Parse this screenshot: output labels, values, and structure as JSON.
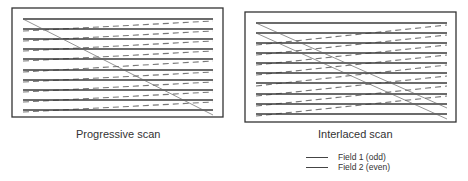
{
  "panels": [
    {
      "id": "progressive",
      "caption": "Progressive scan",
      "frame": {
        "x": 12,
        "y": 8,
        "w": 211,
        "h": 109
      },
      "line_x": [
        23,
        213
      ],
      "solid_lines_y": [
        19,
        29,
        39,
        49,
        59,
        70,
        80,
        90,
        100,
        110
      ],
      "dashed_lines": [
        [
          23,
          31,
          213,
          21
        ],
        [
          23,
          41,
          213,
          31
        ],
        [
          23,
          51,
          213,
          41
        ],
        [
          23,
          61,
          213,
          51
        ],
        [
          23,
          72,
          213,
          61
        ],
        [
          23,
          82,
          213,
          72
        ],
        [
          23,
          92,
          213,
          82
        ],
        [
          23,
          102,
          213,
          92
        ],
        [
          23,
          112,
          213,
          102
        ]
      ],
      "diagonals": [
        [
          23,
          19,
          213,
          115
        ]
      ]
    },
    {
      "id": "interlaced",
      "caption": "Interlaced scan",
      "frame": {
        "x": 245,
        "y": 12,
        "w": 211,
        "h": 110
      },
      "line_x": [
        256,
        447
      ],
      "solid_lines_y": [
        23,
        33,
        43,
        53,
        63,
        73,
        83,
        94,
        104,
        114
      ],
      "dashed_lines": [
        [
          256,
          45,
          447,
          25
        ],
        [
          256,
          55,
          447,
          35
        ],
        [
          256,
          65,
          447,
          45
        ],
        [
          256,
          75,
          447,
          55
        ],
        [
          256,
          86,
          447,
          65
        ],
        [
          256,
          96,
          447,
          76
        ],
        [
          256,
          106,
          447,
          86
        ],
        [
          256,
          116,
          447,
          96
        ]
      ],
      "diagonals": [
        [
          256,
          23,
          447,
          108
        ],
        [
          256,
          33,
          447,
          119
        ]
      ]
    }
  ],
  "legend": {
    "items": [
      {
        "label": "Field 1 (odd)",
        "color": "#444444"
      },
      {
        "label": "Field 2 (even)",
        "color": "#444444"
      }
    ]
  },
  "colors": {
    "frame": "#333333",
    "solid": "#3a3a3a",
    "dashed": "#777777",
    "diagonal": "#666666"
  }
}
